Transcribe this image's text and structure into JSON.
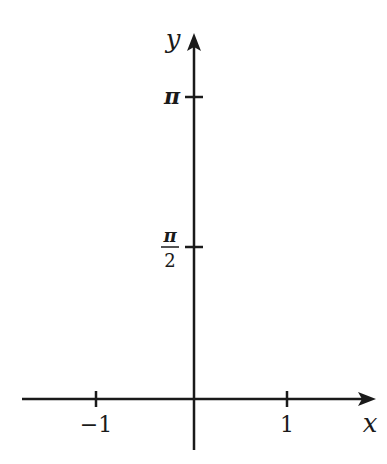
{
  "diagram": {
    "type": "coordinate-axes",
    "axes": {
      "x": {
        "label": "x",
        "ticks": [
          {
            "value": -1,
            "label": "−1"
          },
          {
            "value": 1,
            "label": "1"
          }
        ]
      },
      "y": {
        "label": "y",
        "ticks": [
          {
            "value": "π/2",
            "label_num": "π",
            "label_den": "2"
          },
          {
            "value": "π",
            "label": "π"
          }
        ]
      }
    },
    "colors": {
      "axis": "#1a1a1a",
      "background": "#ffffff"
    }
  }
}
